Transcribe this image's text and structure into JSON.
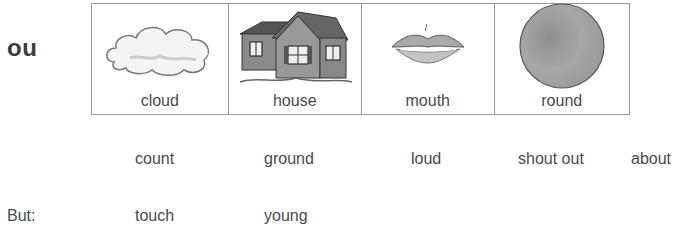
{
  "heading": "ou",
  "picture_cards": [
    {
      "label": "cloud",
      "icon": "cloud-icon"
    },
    {
      "label": "house",
      "icon": "house-icon"
    },
    {
      "label": "mouth",
      "icon": "mouth-icon"
    },
    {
      "label": "round",
      "icon": "circle-icon"
    }
  ],
  "examples": [
    "count",
    "ground",
    "loud",
    "shout out",
    "about"
  ],
  "exceptions": {
    "label": "But:",
    "words": [
      "touch",
      "young"
    ]
  }
}
